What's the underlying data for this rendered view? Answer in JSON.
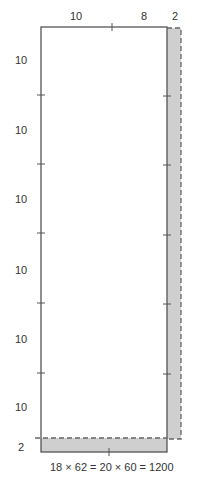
{
  "top_labels": [
    "10",
    "8",
    "2"
  ],
  "left_labels": [
    "10",
    "10",
    "10",
    "10",
    "10",
    "10",
    "2"
  ],
  "equation": "18 × 62 = 20 × 60 = 1200",
  "colors": {
    "stroke": "#555555",
    "shade": "#cfcfcf",
    "dash": "#666666"
  }
}
